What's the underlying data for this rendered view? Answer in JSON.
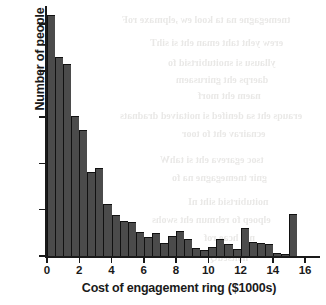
{
  "chart_data": {
    "type": "bar",
    "title": "",
    "xlabel": "Cost of engagement ring ($1000s)",
    "ylabel": "Number of people",
    "grid": false,
    "legend": null,
    "bin_width": 0.5,
    "xlim": [
      0,
      16.8
    ],
    "ylim": [
      0,
      268
    ],
    "xticks": [
      0,
      2,
      4,
      6,
      8,
      10,
      12,
      14,
      16
    ],
    "xtick_labels": [
      "0",
      "2",
      "4",
      "6",
      "8",
      "10",
      "12",
      "14",
      "16"
    ],
    "yticks": [
      0,
      50,
      100,
      150,
      200,
      250
    ],
    "ytick_labels": [
      "0",
      "50",
      "100",
      "150",
      "200",
      "250"
    ],
    "bin_starts": [
      0,
      0.5,
      1,
      1.5,
      2,
      2.5,
      3,
      3.5,
      4,
      4.5,
      5,
      5.5,
      6,
      6.5,
      7,
      7.5,
      8,
      8.5,
      9,
      9.5,
      10,
      10.5,
      11,
      11.5,
      12,
      12.5,
      13,
      13.5,
      14,
      14.5,
      15
    ],
    "values": [
      260,
      215,
      208,
      151,
      136,
      91,
      95,
      56,
      44,
      38,
      37,
      26,
      21,
      25,
      14,
      22,
      27,
      18,
      9,
      7,
      10,
      18,
      13,
      8,
      30,
      15,
      14,
      13,
      3,
      2,
      45
    ],
    "bar_color": "#4b4b4b",
    "bar_edge_color": "#111111"
  },
  "bleed_text": {
    "lines": [
      {
        "text": "tnemegagne na ta kool ew ,elpmaxe roF",
        "x": 122,
        "y": 14,
        "size": 10
      },
      {
        "text": "erew yeht taht eman eht si sihT",
        "x": 150,
        "y": 37,
        "size": 10
      },
      {
        "text": "yllausu si snoitubirtsid fo",
        "x": 168,
        "y": 57,
        "size": 10
      },
      {
        "text": "daerps eht gnirusaem",
        "x": 176,
        "y": 74,
        "size": 10
      },
      {
        "text": "naem eht morf",
        "x": 198,
        "y": 90,
        "size": 10
      },
      {
        "text": "erauqs eht sa denifed si noitaived dradnats",
        "x": 120,
        "y": 110,
        "size": 10
      },
      {
        "text": "ecnairav eht fo toor",
        "x": 182,
        "y": 128,
        "size": 10
      },
      {
        "text": "tsoc egareva eht si tahW",
        "x": 160,
        "y": 154,
        "size": 10
      },
      {
        "text": "gnir tnemegagne na fo",
        "x": 172,
        "y": 172,
        "size": 10
      },
      {
        "text": "noitubirtsid siht nI",
        "x": 188,
        "y": 196,
        "size": 10
      },
      {
        "text": "elpoep fo rebmun eht swohs",
        "x": 152,
        "y": 214,
        "size": 10
      },
      {
        "text": "nib hcae rof",
        "x": 204,
        "y": 232,
        "size": 10
      },
      {
        "text": "noitseuQ",
        "x": 210,
        "y": 252,
        "size": 10
      }
    ]
  }
}
